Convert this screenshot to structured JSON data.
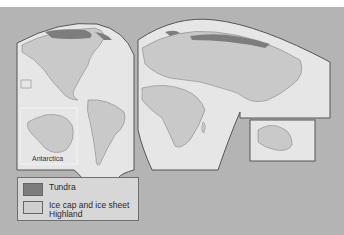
{
  "map": {
    "background_color": "#b4b4b4",
    "land_color": "#c9c9c9",
    "ocean_color": "#e3e3e3",
    "outline_color": "#555555",
    "inset_label": "Antarctica"
  },
  "legend": {
    "items": [
      {
        "label": "Tundra",
        "color": "#7d7d7d"
      },
      {
        "label": "Ice cap and ice sheet",
        "color": "#cfcfcf"
      },
      {
        "label": "Highland",
        "color": "#cfcfcf"
      }
    ]
  }
}
